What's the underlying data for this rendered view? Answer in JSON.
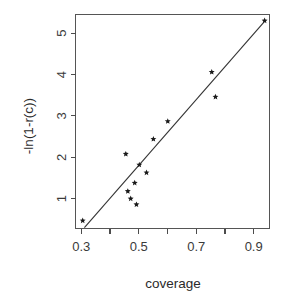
{
  "chart_data": {
    "type": "scatter",
    "title": "",
    "xlabel": "coverage",
    "ylabel": "-ln(1-r(c))",
    "xlim": [
      0.28,
      0.955
    ],
    "ylim": [
      0.28,
      5.45
    ],
    "grid": false,
    "legend": null,
    "x_ticks_major": [
      0.3,
      0.5,
      0.7,
      0.9
    ],
    "x_tick_labels": [
      "0.3",
      "0.5",
      "0.7",
      "0.9"
    ],
    "x_ticks_minor": [
      0.4,
      0.6,
      0.8
    ],
    "y_ticks_major": [
      1,
      2,
      3,
      4,
      5
    ],
    "y_tick_labels": [
      "1",
      "2",
      "3",
      "4",
      "5"
    ],
    "marker": "star",
    "points": [
      {
        "x": 0.305,
        "y": 0.47
      },
      {
        "x": 0.455,
        "y": 2.08
      },
      {
        "x": 0.462,
        "y": 1.18
      },
      {
        "x": 0.472,
        "y": 1.0
      },
      {
        "x": 0.486,
        "y": 1.38
      },
      {
        "x": 0.492,
        "y": 0.86
      },
      {
        "x": 0.502,
        "y": 1.82
      },
      {
        "x": 0.527,
        "y": 1.63
      },
      {
        "x": 0.551,
        "y": 2.44
      },
      {
        "x": 0.601,
        "y": 2.87
      },
      {
        "x": 0.754,
        "y": 4.06
      },
      {
        "x": 0.767,
        "y": 3.46
      },
      {
        "x": 0.938,
        "y": 5.3
      }
    ],
    "reference_line": {
      "x1": 0.311,
      "y1": 0.3,
      "x2": 0.941,
      "y2": 5.31
    }
  }
}
